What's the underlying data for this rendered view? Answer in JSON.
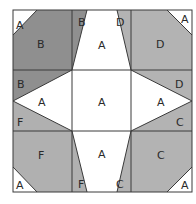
{
  "diagram": {
    "title": "",
    "colors": {
      "B": "#8f8f8f",
      "D": "#b3b3b3",
      "F": "#b0b0b0",
      "C": "#b3b3b3",
      "A": "#ffffff",
      "line": "#3a3a3a"
    },
    "labels": {
      "tl_a": "A",
      "tl_b_big": "B",
      "tl_b_top": "B",
      "tl_b_left": "B",
      "tr_d_top": "D",
      "tr_d_big": "D",
      "tr_a": "A",
      "tr_d_right": "D",
      "top_a": "A",
      "left_a": "A",
      "center_a": "A",
      "right_a": "A",
      "bottom_a": "A",
      "bl_f_left": "F",
      "bl_f_big": "F",
      "bl_a": "A",
      "bl_f_bottom": "F",
      "br_c_right": "C",
      "br_c_big": "C",
      "br_a": "A",
      "br_c_bottom": "C"
    }
  }
}
